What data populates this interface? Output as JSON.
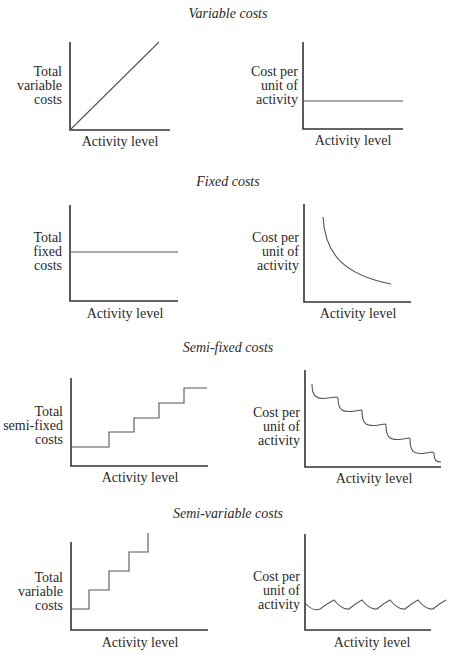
{
  "sections": [
    {
      "title": "Variable costs",
      "left": {
        "ylabel": [
          "Total",
          "variable",
          "costs"
        ],
        "xlabel": "Activity level",
        "shape": "rising diagonal line from origin"
      },
      "right": {
        "ylabel": [
          "Cost per",
          "unit of",
          "activity"
        ],
        "xlabel": "Activity level",
        "shape": "horizontal flat line"
      }
    },
    {
      "title": "Fixed costs",
      "left": {
        "ylabel": [
          "Total",
          "fixed",
          "costs"
        ],
        "xlabel": "Activity level",
        "shape": "horizontal flat line"
      },
      "right": {
        "ylabel": [
          "Cost per",
          "unit of",
          "activity"
        ],
        "xlabel": "Activity level",
        "shape": "decreasing convex curve"
      }
    },
    {
      "title": "Semi-fixed costs",
      "left": {
        "ylabel": [
          "Total",
          "semi-fixed",
          "costs"
        ],
        "xlabel": "Activity level",
        "shape": "rising step function (5 levels)"
      },
      "right": {
        "ylabel": [
          "Cost per",
          "unit of",
          "activity"
        ],
        "xlabel": "Activity level",
        "shape": "descending scalloped sawtooth"
      }
    },
    {
      "title": "Semi-variable costs",
      "left": {
        "ylabel": [
          "Total",
          "variable",
          "costs"
        ],
        "xlabel": "Activity level",
        "shape": "steep rising step function"
      },
      "right": {
        "ylabel": [
          "Cost per",
          "unit of",
          "activity"
        ],
        "xlabel": "Activity level",
        "shape": "flat wavy line"
      }
    }
  ],
  "colors": {
    "line": "#555555",
    "axis": "#333333",
    "text": "#2a2a2a"
  }
}
